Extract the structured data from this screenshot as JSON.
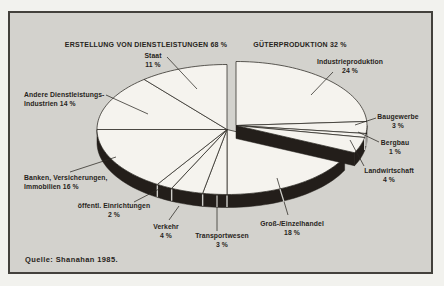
{
  "colors": {
    "paper": "#f2f2ee",
    "panel_background": "#d3d2cd",
    "panel_border": "#43413c",
    "pie_top": "#f5f3ee",
    "pie_side": "#231e1a",
    "line": "#2b2823",
    "notch": "#cfceca",
    "text": "#272420"
  },
  "chart_data": {
    "type": "pie",
    "style": "3d-exploded",
    "unit": "%",
    "source": "Quelle: Shanahan 1985.",
    "groups": [
      {
        "id": "dienstleistungen",
        "title": "ERSTELLUNG VON DIENSTLEISTUNGEN 68 %",
        "total_pct": 68,
        "slices": [
          {
            "name": "Groß-/Einzelhandel",
            "pct": 18,
            "lines": [
              "Groß-/Einzelhandel",
              "18 %"
            ]
          },
          {
            "name": "Transportwesen",
            "pct": 3,
            "lines": [
              "Transportwesen",
              "3 %"
            ]
          },
          {
            "name": "Verkehr",
            "pct": 4,
            "lines": [
              "Verkehr",
              "4 %"
            ]
          },
          {
            "name": "öffentl. Einrichtungen",
            "pct": 2,
            "lines": [
              "öffentl. Einrichtungen",
              "2 %"
            ]
          },
          {
            "name": "Banken, Versicherungen, Immobilien",
            "pct": 16,
            "lines": [
              "Banken, Versicherungen,",
              "Immobilien 16 %"
            ]
          },
          {
            "name": "Andere Dienstleistungsindustrien",
            "pct": 14,
            "lines": [
              "Andere Dienstleistungs-",
              "Industrien 14 %"
            ]
          },
          {
            "name": "Staat",
            "pct": 11,
            "lines": [
              "Staat",
              "11 %"
            ]
          }
        ]
      },
      {
        "id": "gueterproduktion",
        "title": "GÜTERPRODUKTION 32 %",
        "total_pct": 32,
        "slices": [
          {
            "name": "Industrieproduktion",
            "pct": 24,
            "lines": [
              "Industrieproduktion",
              "24 %"
            ]
          },
          {
            "name": "Baugewerbe",
            "pct": 3,
            "lines": [
              "Baugewerbe",
              "3 %"
            ]
          },
          {
            "name": "Bergbau",
            "pct": 1,
            "lines": [
              "Bergbau",
              "1 %"
            ]
          },
          {
            "name": "Landwirtschaft",
            "pct": 4,
            "lines": [
              "Landwirtschaft",
              "4 %"
            ]
          }
        ]
      }
    ]
  }
}
